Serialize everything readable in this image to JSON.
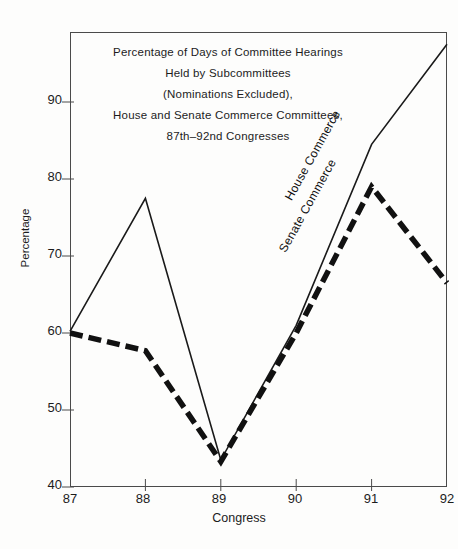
{
  "chart_data": {
    "type": "line",
    "title_lines": [
      "Percentage of Days of Committee Hearings",
      "Held by Subcommittees",
      "(Nominations Excluded),",
      "House and Senate Commerce Committees,",
      "87th–92nd Congresses"
    ],
    "xlabel": "Congress",
    "ylabel": "Percentage",
    "x": [
      87,
      88,
      89,
      90,
      91,
      92
    ],
    "xtick_labels": [
      "87",
      "88",
      "89",
      "90",
      "91",
      "92"
    ],
    "ytick_labels": [
      "40",
      "50",
      "60",
      "70",
      "80",
      "90"
    ],
    "ytick_values": [
      40,
      50,
      60,
      70,
      80,
      90
    ],
    "xlim": [
      87,
      92
    ],
    "ylim": [
      40,
      98
    ],
    "grid": false,
    "legend_position": "inline-on-lines",
    "series": [
      {
        "name": "House Commerce",
        "label": "House Commerce",
        "style": "solid",
        "color": "#1a1a1a",
        "width": 1.6,
        "values": [
          60.2,
          77.5,
          43.5,
          61.0,
          84.5,
          97.5
        ]
      },
      {
        "name": "Senate Commerce",
        "label": "Senate Commerce",
        "style": "dashed",
        "color": "#111111",
        "width": 5.5,
        "values": [
          60.0,
          57.7,
          43.3,
          60.0,
          79.0,
          66.5
        ]
      }
    ]
  }
}
